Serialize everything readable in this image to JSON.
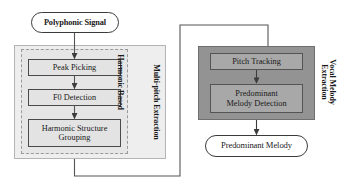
{
  "diagram": {
    "colors": {
      "panel_outer_fill": "#eeeeee",
      "panel_outer_stroke": "#b4b4b4",
      "panel_inner_fill": "#e6e6e6",
      "panel_inner_stroke": "#9a9a9a",
      "panel_dark_fill": "#939393",
      "panel_dark_stroke": "#6f6f6f",
      "box_fill": "#e3e3e3",
      "box_fill_dark": "#a8a8a8",
      "box_stroke": "#4a4a4a",
      "terminal_fill": "#ffffff",
      "terminal_stroke": "#3b3b3b",
      "connector": "#555555",
      "background": "#ffffff"
    },
    "terminals": {
      "input": "Polyphonic Signal",
      "output": "Predominant Melody"
    },
    "group_labels": {
      "multi_pitch": "Multi-pitch Extraction",
      "harmonic_based": "Harmonic Based",
      "vocal_melody_line1": "Vocal Melody",
      "vocal_melody_line2": "Extraction"
    },
    "left_stage_boxes": [
      {
        "label": "Peak Picking"
      },
      {
        "label": "F0 Detection"
      },
      {
        "label_line1": "Harmonic Structure",
        "label_line2": "Grouping"
      }
    ],
    "right_stage_boxes": [
      {
        "label": "Pitch Tracking"
      },
      {
        "label_line1": "Predominant",
        "label_line2": "Melody Detection"
      }
    ],
    "connectors": [
      {
        "name": "input-to-peak-picking",
        "kind": "arrow-down"
      },
      {
        "name": "peak-picking-to-f0-detection",
        "kind": "arrow-down"
      },
      {
        "name": "f0-detection-to-harmonic-structure-grouping",
        "kind": "arrow-down"
      },
      {
        "name": "multi-pitch-to-vocal-melody-feedback",
        "kind": "routed-polyline"
      },
      {
        "name": "pitch-tracking-to-predominant-melody-detection",
        "kind": "arrow-down"
      },
      {
        "name": "predominant-melody-detection-to-output",
        "kind": "arrow-down"
      }
    ]
  }
}
